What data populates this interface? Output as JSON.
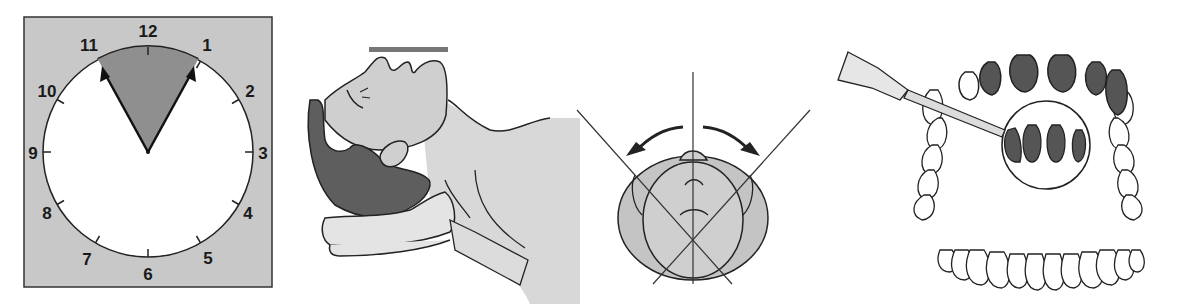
{
  "figure": {
    "panels": [
      {
        "id": "clock",
        "description": "Clock face with shaded sector from 11 to 1",
        "numbers": [
          "12",
          "1",
          "2",
          "3",
          "4",
          "5",
          "6",
          "7",
          "8",
          "9",
          "10",
          "11"
        ],
        "highlight_from": "11",
        "highlight_to": "1"
      },
      {
        "id": "head-extension",
        "description": "Supine patient with head tilted back on a pillow, bar marker above face"
      },
      {
        "id": "head-rotation",
        "description": "Top view of head with rotation arrows left and right, reference lines"
      },
      {
        "id": "teeth-swab",
        "description": "Applicator stick on upper anterior teeth with magnified inset, lower dental arch below"
      }
    ]
  },
  "colors": {
    "frame_gray": "#c8c8c8",
    "sector_gray": "#8f8f8f",
    "skin_gray": "#cfcfcf",
    "hair_dark": "#5e5e5e",
    "line": "#1a1a1a",
    "tooth_shade": "#555555"
  }
}
